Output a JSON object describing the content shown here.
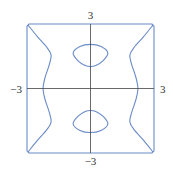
{
  "chart_data": {
    "type": "line",
    "title": "",
    "xlabel": "",
    "ylabel": "",
    "xlim": [
      -3,
      3
    ],
    "ylim": [
      -3,
      3
    ],
    "grid": false,
    "legend": null,
    "tick_labels": {
      "x_min": "−3",
      "x_max": "3",
      "y_min": "−3",
      "y_max": "3"
    },
    "colors": {
      "curve": "#6a8cc8",
      "axis": "#444444"
    },
    "series": [
      {
        "name": "boundary-square",
        "closed": true,
        "points": [
          [
            -2.9,
            3
          ],
          [
            2.9,
            3
          ],
          [
            3,
            2.9
          ],
          [
            3,
            -2.9
          ],
          [
            2.9,
            -3
          ],
          [
            -2.9,
            -3
          ],
          [
            -3,
            -2.9
          ],
          [
            -3,
            2.9
          ]
        ]
      },
      {
        "name": "left-branch",
        "closed": false,
        "points": [
          [
            -2.95,
            2.95
          ],
          [
            -2.5,
            2.4
          ],
          [
            -2.05,
            1.9
          ],
          [
            -1.86,
            1.55
          ],
          [
            -1.95,
            1.1
          ],
          [
            -2.15,
            0.5
          ],
          [
            -2.24,
            0
          ],
          [
            -2.15,
            -0.5
          ],
          [
            -1.95,
            -1.1
          ],
          [
            -1.86,
            -1.55
          ],
          [
            -2.05,
            -1.9
          ],
          [
            -2.5,
            -2.4
          ],
          [
            -2.95,
            -2.95
          ]
        ]
      },
      {
        "name": "right-branch",
        "closed": false,
        "points": [
          [
            2.95,
            2.95
          ],
          [
            2.5,
            2.4
          ],
          [
            2.05,
            1.9
          ],
          [
            1.86,
            1.55
          ],
          [
            1.95,
            1.1
          ],
          [
            2.15,
            0.5
          ],
          [
            2.24,
            0
          ],
          [
            2.15,
            -0.5
          ],
          [
            1.95,
            -1.1
          ],
          [
            1.86,
            -1.55
          ],
          [
            2.05,
            -1.9
          ],
          [
            2.5,
            -2.4
          ],
          [
            2.95,
            -2.95
          ]
        ]
      },
      {
        "name": "upper-oval",
        "closed": true,
        "points": [
          [
            0,
            2.05
          ],
          [
            0.5,
            1.95
          ],
          [
            0.82,
            1.65
          ],
          [
            0.6,
            1.3
          ],
          [
            0.25,
            1.07
          ],
          [
            0,
            1.02
          ],
          [
            -0.25,
            1.07
          ],
          [
            -0.6,
            1.3
          ],
          [
            -0.82,
            1.65
          ],
          [
            -0.5,
            1.95
          ]
        ]
      },
      {
        "name": "lower-oval",
        "closed": true,
        "points": [
          [
            0,
            -2.05
          ],
          [
            0.5,
            -1.95
          ],
          [
            0.82,
            -1.65
          ],
          [
            0.6,
            -1.3
          ],
          [
            0.25,
            -1.07
          ],
          [
            0,
            -1.02
          ],
          [
            -0.25,
            -1.07
          ],
          [
            -0.6,
            -1.3
          ],
          [
            -0.82,
            -1.65
          ],
          [
            -0.5,
            -1.95
          ]
        ]
      }
    ]
  }
}
